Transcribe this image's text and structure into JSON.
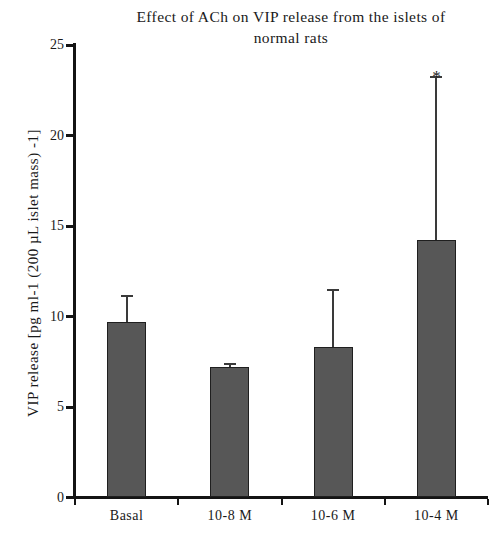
{
  "chart_data": {
    "type": "bar",
    "title": "Effect of ACh on VIP release from the islets of\nnormal rats",
    "xlabel": "",
    "ylabel": "VIP release [pg ml-1 (200 µL islet mass) -1]",
    "categories": [
      "Basal",
      "10-8 M",
      "10-6 M",
      "10-4 M"
    ],
    "values": [
      9.7,
      7.2,
      8.3,
      14.2
    ],
    "errors": [
      1.5,
      0.25,
      3.2,
      9.1
    ],
    "error_type": "upper-only",
    "annotations": [
      {
        "category": "10-4 M",
        "text": "*",
        "y": 23.3
      }
    ],
    "ylim": [
      0,
      25
    ],
    "yticks": [
      0,
      5,
      10,
      15,
      20,
      25
    ],
    "ytick_labels": [
      "0",
      "5",
      "10",
      "15",
      "20",
      "25"
    ],
    "grid": false,
    "legend": false,
    "bar_color": "#575757",
    "bar_edge_color": "#1f1f1f",
    "axis_color": "#141414",
    "text_color": "#1a1a1a"
  },
  "figure": {
    "background": "#ffffff"
  }
}
